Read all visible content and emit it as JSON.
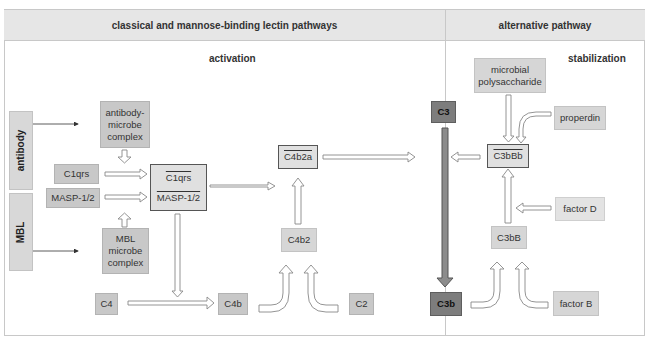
{
  "headers": {
    "left": "classical and mannose-binding lectin pathways",
    "right": "alternative pathway"
  },
  "subheaders": {
    "activation": "activation",
    "stabilization": "stabilization"
  },
  "side_labels": {
    "antibody": "antibody",
    "mbl": "MBL"
  },
  "nodes": {
    "antibody_microbe_complex": [
      "antibody-",
      "microbe",
      "complex"
    ],
    "c1qrs": "C1qrs",
    "masp": "MASP-1/2",
    "active_c1qrs": "C1qrs",
    "active_masp": "MASP-1/2",
    "mbl_microbe_complex": [
      "MBL",
      "microbe",
      "complex"
    ],
    "c4": "C4",
    "c4b": "C4b",
    "c4b2": "C4b2",
    "c2": "C2",
    "c4b2a": "C4b2a",
    "c3": "C3",
    "c3b": "C3b",
    "microbial_polysaccharide": [
      "microbial",
      "polysaccharide"
    ],
    "properdin": "properdin",
    "c3bbb": "C3bBb",
    "factor_d": "factor D",
    "c3bb": "C3bB",
    "factor_b": "factor B"
  },
  "colors": {
    "box_gray": "#c8c8c8",
    "box_light": "#e3e3e3",
    "box_dark": "#7d7d7d",
    "header_bg": "#e6e6e6",
    "border": "#c8c8c8"
  }
}
